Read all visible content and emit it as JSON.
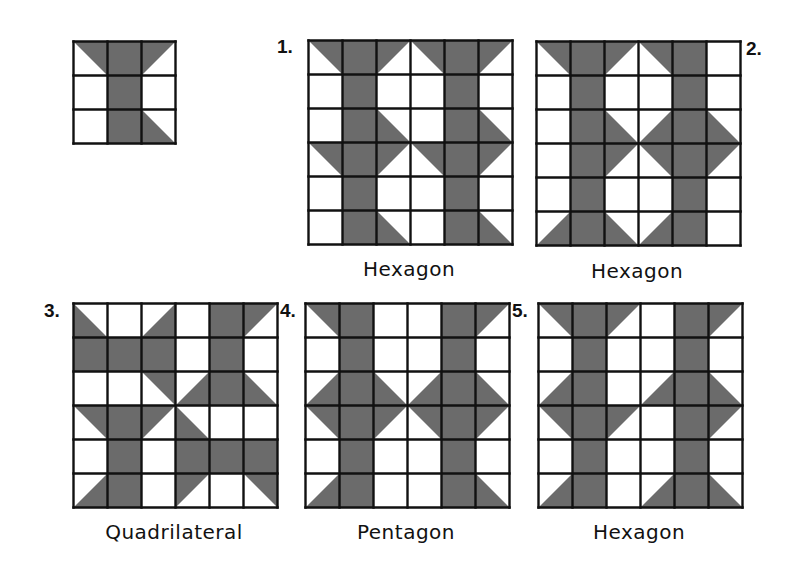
{
  "colors": {
    "fill": "#6b6b6b",
    "line": "#111111",
    "background": "#ffffff"
  },
  "legend": {
    "codes": {
      "F": "full gray square",
      "W": "white square",
      "TR": "gray triangle in top-right half",
      "TL": "gray triangle in top-left half",
      "BL": "gray triangle in bottom-left half",
      "BR": "gray triangle in bottom-right half"
    }
  },
  "tile": {
    "rows": [
      [
        "TR",
        "F",
        "TL"
      ],
      [
        "W",
        "F",
        "W"
      ],
      [
        "W",
        "F",
        "BL"
      ]
    ]
  },
  "figures": [
    {
      "number": "1.",
      "label": "Hexagon",
      "rows": [
        [
          "TR",
          "F",
          "TL",
          "TR",
          "F",
          "TL"
        ],
        [
          "W",
          "F",
          "W",
          "W",
          "F",
          "W"
        ],
        [
          "W",
          "F",
          "BL",
          "W",
          "F",
          "BL"
        ],
        [
          "TR",
          "F",
          "TL",
          "TR",
          "F",
          "TL"
        ],
        [
          "W",
          "F",
          "W",
          "W",
          "F",
          "W"
        ],
        [
          "W",
          "F",
          "BL",
          "W",
          "F",
          "BL"
        ]
      ]
    },
    {
      "number": "2.",
      "label": "Hexagon",
      "rows": [
        [
          "TR",
          "F",
          "TL",
          "TR",
          "F",
          "W"
        ],
        [
          "W",
          "F",
          "W",
          "W",
          "F",
          "W"
        ],
        [
          "W",
          "F",
          "BL",
          "BR",
          "F",
          "BL"
        ],
        [
          "W",
          "F",
          "TL",
          "TR",
          "F",
          "TL"
        ],
        [
          "W",
          "F",
          "W",
          "W",
          "F",
          "W"
        ],
        [
          "BR",
          "F",
          "BL",
          "BR",
          "F",
          "W"
        ]
      ]
    },
    {
      "number": "3.",
      "label": "Quadrilateral",
      "rows": [
        [
          "BL",
          "W",
          "BR",
          "W",
          "F",
          "TL"
        ],
        [
          "F",
          "F",
          "F",
          "W",
          "F",
          "W"
        ],
        [
          "W",
          "W",
          "TR",
          "BR",
          "F",
          "BL"
        ],
        [
          "TR",
          "F",
          "TL",
          "BL",
          "W",
          "W"
        ],
        [
          "W",
          "F",
          "W",
          "F",
          "F",
          "F"
        ],
        [
          "BR",
          "F",
          "W",
          "TL",
          "W",
          "TR"
        ]
      ]
    },
    {
      "number": "4.",
      "label": "Pentagon",
      "rows": [
        [
          "TR",
          "F",
          "W",
          "W",
          "F",
          "TL"
        ],
        [
          "W",
          "F",
          "W",
          "W",
          "F",
          "W"
        ],
        [
          "BR",
          "F",
          "BL",
          "BR",
          "F",
          "BL"
        ],
        [
          "TR",
          "F",
          "TL",
          "TR",
          "F",
          "TL"
        ],
        [
          "W",
          "F",
          "W",
          "W",
          "F",
          "W"
        ],
        [
          "BR",
          "F",
          "W",
          "W",
          "F",
          "BL"
        ]
      ]
    },
    {
      "number": "5.",
      "label": "Hexagon",
      "rows": [
        [
          "TR",
          "F",
          "TL",
          "W",
          "F",
          "TL"
        ],
        [
          "W",
          "F",
          "W",
          "W",
          "F",
          "W"
        ],
        [
          "BR",
          "F",
          "W",
          "BR",
          "F",
          "BL"
        ],
        [
          "TR",
          "F",
          "TL",
          "W",
          "F",
          "TL"
        ],
        [
          "W",
          "F",
          "W",
          "W",
          "F",
          "W"
        ],
        [
          "BR",
          "F",
          "W",
          "BR",
          "F",
          "BL"
        ]
      ]
    }
  ]
}
